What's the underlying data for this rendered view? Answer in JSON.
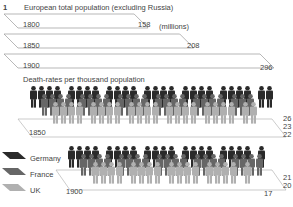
{
  "figure_number": "1",
  "population_title": "European total population (excluding Russia)",
  "population_unit": "(millions)",
  "death_title": "Death-rates per thousand population",
  "legend": [
    {
      "label": "Germany",
      "color": "#2a2a2a"
    },
    {
      "label": "France",
      "color": "#666666"
    },
    {
      "label": "UK",
      "color": "#b0b0b0"
    }
  ],
  "chart_data": [
    {
      "type": "bar",
      "title": "European total population (excluding Russia)",
      "ylabel": "(millions)",
      "categories": [
        "1800",
        "1850",
        "1900"
      ],
      "values": [
        158,
        208,
        296
      ]
    },
    {
      "type": "bar",
      "title": "Death-rates per thousand population",
      "categories": [
        "1850",
        "1900"
      ],
      "series": [
        {
          "name": "Germany",
          "values": [
            26,
            21
          ]
        },
        {
          "name": "France",
          "values": [
            23,
            20
          ]
        },
        {
          "name": "UK",
          "values": [
            22,
            17
          ]
        }
      ]
    }
  ],
  "labels": {
    "y1800": "1800",
    "v1800": "158",
    "y1850": "1850",
    "v1850": "208",
    "y1900": "1900",
    "v1900": "296",
    "d1850": "1850",
    "d1900": "1900",
    "g1850": "26",
    "f1850": "23",
    "u1850": "22",
    "g1900": "21",
    "f1900": "20",
    "u1900": "17"
  }
}
